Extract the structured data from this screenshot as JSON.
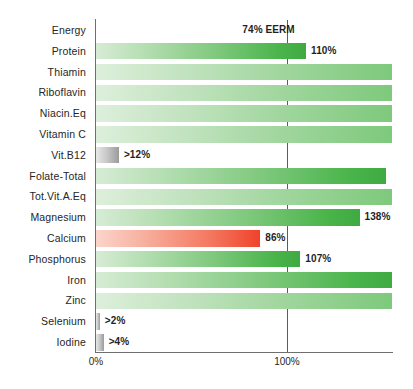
{
  "chart_data": {
    "type": "bar",
    "orientation": "horizontal",
    "title": "",
    "xlabel": "",
    "ylabel": "",
    "xlim": [
      0,
      155
    ],
    "xticks": [
      0,
      100
    ],
    "xtick_labels": [
      "0%",
      "100%"
    ],
    "grid": "vertical-reference-at-100",
    "legend": "none",
    "reference_line": 100,
    "categories": [
      "Energy",
      "Protein",
      "Thiamin",
      "Riboflavin",
      "Niacin.Eq",
      "Vitamin C",
      "Vit.B12",
      "Folate-Total",
      "Tot.Vit.A.Eq",
      "Magnesium",
      "Calcium",
      "Phosphorus",
      "Iron",
      "Zinc",
      "Selenium",
      "Iodine"
    ],
    "values": [
      74,
      110,
      155,
      155,
      155,
      155,
      12,
      152,
      155,
      138,
      86,
      107,
      155,
      155,
      2,
      4
    ],
    "bars": [
      {
        "category": "Energy",
        "value": 74,
        "label": "74% EERM",
        "color": "orange",
        "clipped": false,
        "estimate": false
      },
      {
        "category": "Protein",
        "value": 110,
        "label": "110%",
        "color": "green",
        "clipped": false,
        "estimate": false
      },
      {
        "category": "Thiamin",
        "value": 155,
        "label": "",
        "color": "green-lite",
        "clipped": true,
        "estimate": false
      },
      {
        "category": "Riboflavin",
        "value": 155,
        "label": "",
        "color": "green-lite",
        "clipped": true,
        "estimate": false
      },
      {
        "category": "Niacin.Eq",
        "value": 155,
        "label": "",
        "color": "green-lite",
        "clipped": true,
        "estimate": false
      },
      {
        "category": "Vitamin C",
        "value": 155,
        "label": "",
        "color": "green-lite",
        "clipped": true,
        "estimate": false
      },
      {
        "category": "Vit.B12",
        "value": 12,
        "label": ">12%",
        "color": "grey",
        "clipped": false,
        "estimate": true
      },
      {
        "category": "Folate-Total",
        "value": 152,
        "label": "",
        "color": "green",
        "clipped": false,
        "estimate": false
      },
      {
        "category": "Tot.Vit.A.Eq",
        "value": 155,
        "label": "",
        "color": "green-lite",
        "clipped": true,
        "estimate": false
      },
      {
        "category": "Magnesium",
        "value": 138,
        "label": "138%",
        "color": "green",
        "clipped": false,
        "estimate": false
      },
      {
        "category": "Calcium",
        "value": 86,
        "label": "86%",
        "color": "red",
        "clipped": false,
        "estimate": false
      },
      {
        "category": "Phosphorus",
        "value": 107,
        "label": "107%",
        "color": "green",
        "clipped": false,
        "estimate": false
      },
      {
        "category": "Iron",
        "value": 155,
        "label": "",
        "color": "green",
        "clipped": true,
        "estimate": false
      },
      {
        "category": "Zinc",
        "value": 155,
        "label": "",
        "color": "green-lite",
        "clipped": true,
        "estimate": false
      },
      {
        "category": "Selenium",
        "value": 2,
        "label": ">2%",
        "color": "grey",
        "clipped": false,
        "estimate": true
      },
      {
        "category": "Iodine",
        "value": 4,
        "label": ">4%",
        "color": "grey",
        "clipped": false,
        "estimate": true
      }
    ],
    "colors": {
      "orange": "#f9a81d",
      "green": "#3faa41",
      "green_light": "#9ed59b",
      "red": "#f0422a",
      "grey": "#9b9b9b",
      "axis": "#6e6e6e",
      "reference_line": "#5c5c5c",
      "background": "#ffffff"
    }
  }
}
